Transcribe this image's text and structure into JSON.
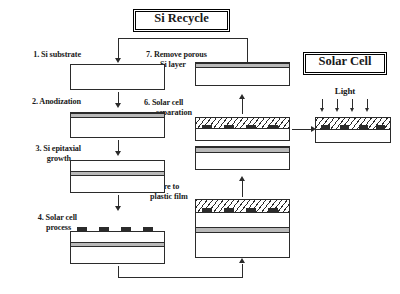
{
  "diagram": {
    "title": "Si Recycle",
    "output_title": "Solar Cell",
    "light_label": "Light",
    "light_arrow_count": 4
  },
  "steps": [
    {
      "id": "step1",
      "number": "1.",
      "label": "1. Si substrate",
      "layers": [
        "substrate"
      ]
    },
    {
      "id": "step2",
      "number": "2.",
      "label": "2. Anodization",
      "layers": [
        "porous",
        "substrate"
      ]
    },
    {
      "id": "step3",
      "number": "3.",
      "label": "3. Si epitaxial\ngrowth",
      "layers": [
        "epitaxial",
        "porous",
        "substrate"
      ]
    },
    {
      "id": "step4",
      "number": "4.",
      "label": "4. Solar cell\nprocess",
      "layers": [
        "electrodes",
        "epitaxial",
        "porous",
        "substrate"
      ]
    },
    {
      "id": "step5",
      "number": "5.",
      "label": "5. Adhere to\nplastic film",
      "layers": [
        "plastic-film",
        "electrodes",
        "epitaxial",
        "porous",
        "substrate"
      ]
    },
    {
      "id": "step6",
      "number": "6.",
      "label": "6. Solar cell\nseparation",
      "layers": [
        "plastic-film",
        "electrodes",
        "epitaxial"
      ]
    },
    {
      "id": "step7",
      "number": "7.",
      "label": "7. Remove porous\nSi layer",
      "layers": [
        "porous",
        "substrate"
      ]
    }
  ],
  "labels": {
    "step1": "1. Si substrate",
    "step2": "2. Anodization",
    "step3_line1": "3. Si epitaxial",
    "step3_line2": "growth",
    "step4_line1": "4. Solar cell",
    "step4_line2": "process",
    "step5_line1": "5. Adhere to",
    "step5_line2": "plastic film",
    "step6_line1": "6. Solar cell",
    "step6_line2": "separation",
    "step7_line1": "7. Remove porous",
    "step7_line2": "Si layer"
  },
  "colors": {
    "line": "#2b2b2b",
    "porous_layer": "#b9b9b9",
    "electrode": "#2b2b2b",
    "background": "#ffffff"
  },
  "flow": {
    "sequence": [
      "step1",
      "step2",
      "step3",
      "step4",
      "step5",
      "step6",
      "step7",
      "step1"
    ],
    "output": "Solar Cell",
    "recycle_from": "step7",
    "recycle_to": "step1",
    "separation_output_to": "Solar Cell"
  }
}
